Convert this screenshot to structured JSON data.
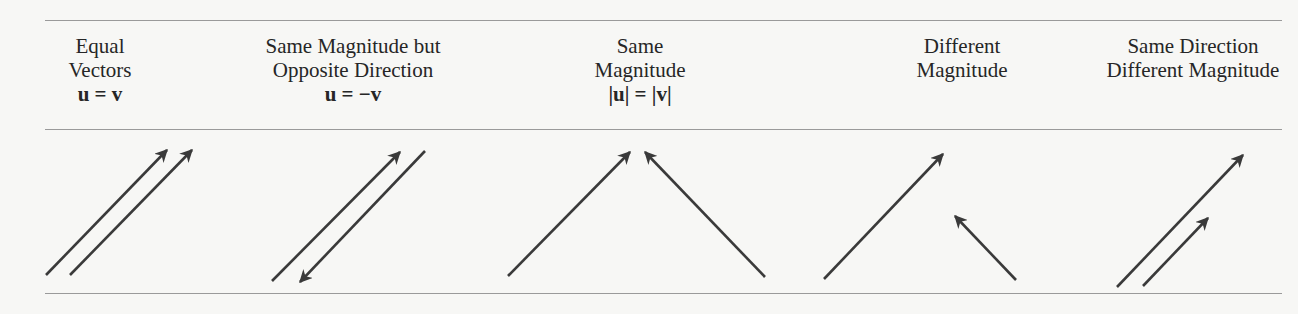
{
  "figure": {
    "columns": [
      {
        "id": "equal",
        "title_lines": [
          "Equal",
          "Vectors"
        ],
        "equation": "u = v",
        "center_x": 100
      },
      {
        "id": "opposite",
        "title_lines": [
          "Same Magnitude but",
          "Opposite Direction"
        ],
        "equation": "u = −v",
        "center_x": 353
      },
      {
        "id": "same-magnitude",
        "title_lines": [
          "Same",
          "Magnitude"
        ],
        "equation": "|u| = |v|",
        "center_x": 640
      },
      {
        "id": "different-magnitude",
        "title_lines": [
          "Different",
          "Magnitude"
        ],
        "equation": "",
        "center_x": 962
      },
      {
        "id": "same-direction",
        "title_lines": [
          "Same Direction",
          "Different Magnitude"
        ],
        "equation": "",
        "center_x": 1193
      }
    ],
    "vectors": [
      {
        "column": "equal",
        "x1": 46,
        "y1": 275,
        "x2": 167,
        "y2": 150
      },
      {
        "column": "equal",
        "x1": 70,
        "y1": 275,
        "x2": 192,
        "y2": 150
      },
      {
        "column": "opposite",
        "x1": 272,
        "y1": 281,
        "x2": 400,
        "y2": 152
      },
      {
        "column": "opposite",
        "x1": 425,
        "y1": 151,
        "x2": 300,
        "y2": 282
      },
      {
        "column": "same-magnitude",
        "x1": 508,
        "y1": 276,
        "x2": 630,
        "y2": 152
      },
      {
        "column": "same-magnitude",
        "x1": 765,
        "y1": 277,
        "x2": 645,
        "y2": 152
      },
      {
        "column": "different-magnitude",
        "x1": 824,
        "y1": 279,
        "x2": 943,
        "y2": 154
      },
      {
        "column": "different-magnitude",
        "x1": 1016,
        "y1": 280,
        "x2": 955,
        "y2": 216
      },
      {
        "column": "same-direction",
        "x1": 1117,
        "y1": 287,
        "x2": 1243,
        "y2": 155
      },
      {
        "column": "same-direction",
        "x1": 1143,
        "y1": 286,
        "x2": 1208,
        "y2": 218
      }
    ],
    "colors": {
      "vector": "#3a3a3a",
      "rule": "#9a9a9a",
      "text": "#262626",
      "background": "#f7f7f5"
    }
  }
}
